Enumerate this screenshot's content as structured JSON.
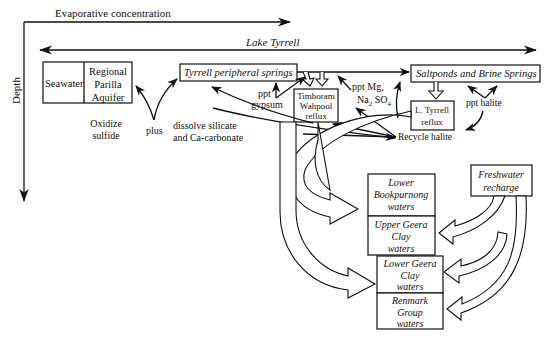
{
  "axes": {
    "horizontal_label": "Evaporative concentration",
    "vertical_label": "Depth",
    "lake_label": "Lake Tyrrell"
  },
  "boxes": {
    "seawater": "Seawater",
    "regional": [
      "Regional",
      "Parilla",
      "Aquifer"
    ],
    "peripheral_springs": "Tyrrell peripheral springs",
    "saltponds": "Saltponds and Brine Springs",
    "timboram": [
      "Timboram",
      "Wahpool",
      "reflux"
    ],
    "l_tyrrell": [
      "L. Tyrrell",
      "reflux"
    ],
    "freshwater": [
      "Freshwater",
      "recharge"
    ],
    "lower_bookpurnong": [
      "Lower",
      "Bookpurnong",
      "waters"
    ],
    "upper_geera": [
      "Upper Geera",
      "Clay",
      "waters"
    ],
    "lower_geera": [
      "Lower Geera",
      "Clay",
      "waters"
    ],
    "renmark": [
      "Renmark",
      "Group",
      "waters"
    ]
  },
  "labels": {
    "oxidize": [
      "Oxidize",
      "sulfide"
    ],
    "plus": "plus",
    "dissolve": [
      "dissolve silicate",
      "and Ca-carbonate"
    ],
    "ppt_gypsum": [
      "ppt",
      "gypsum"
    ],
    "ppt_mg_line1": "ppt Mg,",
    "ppt_mg_na": "Na",
    "ppt_mg_sub2": "2",
    "ppt_mg_so": " SO",
    "ppt_mg_sub4": "4",
    "ppt_halite": "ppt halite",
    "recycle_halite": "Recycle halite"
  },
  "colors": {
    "ink": "#111111",
    "background": "#ffffff"
  }
}
